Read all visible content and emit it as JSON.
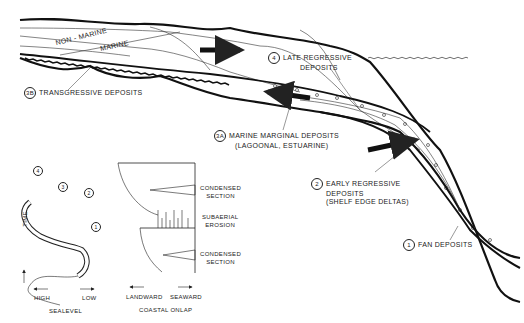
{
  "diagram": {
    "type": "sequence-stratigraphy-cross-section",
    "facies_labels": {
      "non_marine": "NON - MARINE",
      "marine": "MARINE"
    },
    "units": [
      {
        "id": "4",
        "label_line1": "LATE REGRESSIVE",
        "label_line2": "DEPOSITS"
      },
      {
        "id": "3B",
        "label_line1": "TRANSGRESSIVE DEPOSITS"
      },
      {
        "id": "3A",
        "label_line1": "MARINE MARGINAL DEPOSITS",
        "label_line2": "(LAGOONAL, ESTUARINE)"
      },
      {
        "id": "2",
        "label_line1": "EARLY REGRESSIVE",
        "label_line2": "DEPOSITS",
        "label_line3": "(SHELF EDGE DELTAS)"
      },
      {
        "id": "1",
        "label_line1": "FAN DEPOSITS"
      }
    ],
    "sea_level_curve": {
      "axis_label": "TIME",
      "x_left": "HIGH",
      "x_right": "LOW",
      "title": "SEALEVEL",
      "markers": [
        "1",
        "2",
        "3",
        "4"
      ]
    },
    "coastal_onlap": {
      "labels": [
        "CONDENSED",
        "SECTION",
        "SUBAERIAL",
        "EROSION",
        "CONDENSED",
        "SECTION"
      ],
      "condensed_1_line1": "CONDENSED",
      "condensed_1_line2": "SECTION",
      "erosion_line1": "SUBAERIAL",
      "erosion_line2": "EROSION",
      "condensed_2_line1": "CONDENSED",
      "condensed_2_line2": "SECTION",
      "x_left": "LANDWARD",
      "x_right": "SEAWARD",
      "title": "COASTAL ONLAP"
    }
  }
}
